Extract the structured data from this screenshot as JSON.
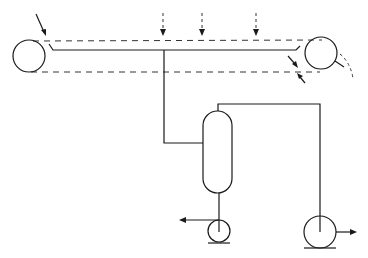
{
  "diagram": {
    "type": "process-flow",
    "colors": {
      "line": "#1a1a1a",
      "dashed": "#333333",
      "background": "#ffffff"
    },
    "components": [
      {
        "id": "left-roller",
        "kind": "roller",
        "label": ""
      },
      {
        "id": "right-roller",
        "kind": "roller",
        "label": ""
      },
      {
        "id": "belt-top",
        "kind": "dashed-belt",
        "label": ""
      },
      {
        "id": "belt-bottom",
        "kind": "dashed-belt",
        "label": ""
      },
      {
        "id": "trough",
        "kind": "collection-line",
        "label": ""
      },
      {
        "id": "spray-1",
        "kind": "dashed-feed-arrow",
        "label": ""
      },
      {
        "id": "spray-2",
        "kind": "dashed-feed-arrow",
        "label": ""
      },
      {
        "id": "spray-3",
        "kind": "dashed-feed-arrow",
        "label": ""
      },
      {
        "id": "feed-inlet",
        "kind": "inlet-arrow",
        "label": ""
      },
      {
        "id": "scraper",
        "kind": "scraper",
        "label": ""
      },
      {
        "id": "separator-vessel",
        "kind": "vertical-vessel",
        "label": ""
      },
      {
        "id": "bottom-pump",
        "kind": "pump",
        "label": ""
      },
      {
        "id": "overhead-pump",
        "kind": "pump",
        "label": ""
      }
    ],
    "connections": [
      {
        "from": "trough",
        "to": "separator-vessel"
      },
      {
        "from": "separator-vessel",
        "to": "bottom-pump",
        "via": "bottom outlet"
      },
      {
        "from": "separator-vessel",
        "to": "overhead-pump",
        "via": "top outlet"
      },
      {
        "from": "bottom-pump",
        "to": "outlet-left"
      },
      {
        "from": "overhead-pump",
        "to": "outlet-right"
      }
    ],
    "text_labels": []
  }
}
